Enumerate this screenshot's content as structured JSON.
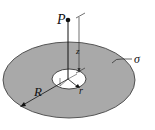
{
  "diagram": {
    "type": "annular disk with point above center",
    "labels": {
      "point": "P",
      "height": "z",
      "outer_radius": "R",
      "inner_radius": "r",
      "surface_charge": "σ"
    },
    "colors": {
      "disk_fill": "#a9a9a9",
      "disk_stroke": "#333333",
      "hole_fill": "#ffffff",
      "line": "#111111",
      "background": "#ffffff"
    }
  }
}
